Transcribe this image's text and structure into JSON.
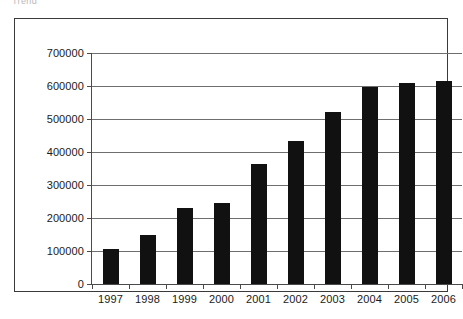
{
  "clipped_header_text": "Trend",
  "chart_data": {
    "type": "bar",
    "title": "",
    "subtitle": "",
    "xlabel": "",
    "ylabel": "",
    "categories": [
      "1997",
      "1998",
      "1999",
      "2000",
      "2001",
      "2002",
      "2003",
      "2004",
      "2005",
      "2006"
    ],
    "values": [
      105000,
      148000,
      230000,
      245000,
      365000,
      432000,
      522000,
      597000,
      608000,
      615000
    ],
    "series": [
      {
        "name": "",
        "values": [
          105000,
          148000,
          230000,
          245000,
          365000,
          432000,
          522000,
          597000,
          608000,
          615000
        ]
      }
    ],
    "ylim": [
      0,
      700000
    ],
    "ytick_values": [
      0,
      100000,
      200000,
      300000,
      400000,
      500000,
      600000,
      700000
    ],
    "ytick_labels": [
      "0",
      "100000",
      "200000",
      "300000",
      "400000",
      "500000",
      "600000",
      "700000"
    ],
    "grid": true,
    "grid_axis": "y",
    "legend": false,
    "legend_position": "none",
    "bar_color": "#111111",
    "axis_color": "#4a4a4a",
    "grid_color": "#6e6e6e",
    "background_color": "#ffffff",
    "annotations": []
  }
}
